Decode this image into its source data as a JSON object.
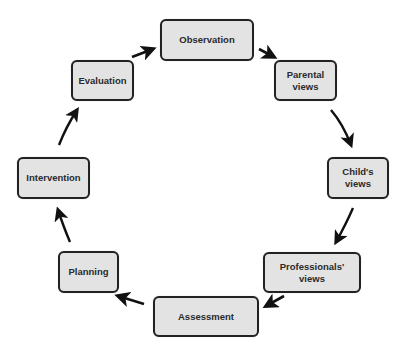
{
  "diagram": {
    "type": "cycle",
    "nodes": [
      {
        "id": "observation",
        "label": "Observation",
        "x": 160,
        "y": 19,
        "w": 94,
        "h": 42
      },
      {
        "id": "parental-views",
        "label": "Parental\nviews",
        "x": 274,
        "y": 60,
        "w": 63,
        "h": 41
      },
      {
        "id": "childs-views",
        "label": "Child's\nviews",
        "x": 327,
        "y": 157,
        "w": 62,
        "h": 42
      },
      {
        "id": "professionals-views",
        "label": "Professionals'\nviews",
        "x": 263,
        "y": 252,
        "w": 98,
        "h": 41
      },
      {
        "id": "assessment",
        "label": "Assessment",
        "x": 153,
        "y": 296,
        "w": 106,
        "h": 41
      },
      {
        "id": "planning",
        "label": "Planning",
        "x": 58,
        "y": 251,
        "w": 61,
        "h": 42
      },
      {
        "id": "intervention",
        "label": "Intervention",
        "x": 17,
        "y": 157,
        "w": 73,
        "h": 42
      },
      {
        "id": "evaluation",
        "label": "Evaluation",
        "x": 71,
        "y": 60,
        "w": 63,
        "h": 41
      }
    ],
    "edges": [
      {
        "from": "observation",
        "to": "parental-views"
      },
      {
        "from": "parental-views",
        "to": "childs-views"
      },
      {
        "from": "childs-views",
        "to": "professionals-views"
      },
      {
        "from": "professionals-views",
        "to": "assessment"
      },
      {
        "from": "assessment",
        "to": "planning"
      },
      {
        "from": "planning",
        "to": "intervention"
      },
      {
        "from": "intervention",
        "to": "evaluation"
      },
      {
        "from": "evaluation",
        "to": "observation"
      }
    ],
    "colors": {
      "node_fill": "#e3e3e3",
      "node_border": "#222222",
      "text": "#2a2a2a",
      "arrow": "#111111"
    }
  }
}
